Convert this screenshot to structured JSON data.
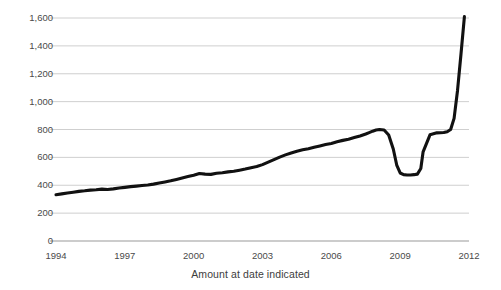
{
  "chart_data": {
    "type": "line",
    "title": "",
    "xlabel": "Amount at date indicated",
    "ylabel": "Billions of dollars",
    "xlim": [
      1994,
      2012
    ],
    "ylim": [
      0,
      1600
    ],
    "xticks": [
      "1994",
      "1997",
      "2000",
      "2003",
      "2006",
      "2009",
      "2012"
    ],
    "xtick_values": [
      1994,
      1997,
      2000,
      2003,
      2006,
      2009,
      2012
    ],
    "yticks": [
      "0",
      "200",
      "400",
      "600",
      "800",
      "1,000",
      "1,200",
      "1,400",
      "1,600"
    ],
    "ytick_values": [
      0,
      200,
      400,
      600,
      800,
      1000,
      1200,
      1400,
      1600
    ],
    "grid": "horizontal",
    "legend": "none",
    "line_color": "#111111",
    "grid_color": "#c9c9c9",
    "axis_color": "#9a9a9a",
    "series": [
      {
        "name": "Amount at date indicated",
        "x": [
          1994.0,
          1994.25,
          1994.5,
          1994.75,
          1995.0,
          1995.25,
          1995.5,
          1995.75,
          1996.0,
          1996.25,
          1996.5,
          1996.75,
          1997.0,
          1997.25,
          1997.5,
          1997.75,
          1998.0,
          1998.25,
          1998.5,
          1998.75,
          1999.0,
          1999.25,
          1999.5,
          1999.75,
          2000.0,
          2000.25,
          2000.5,
          2000.75,
          2001.0,
          2001.25,
          2001.5,
          2001.75,
          2002.0,
          2002.25,
          2002.5,
          2002.75,
          2003.0,
          2003.25,
          2003.5,
          2003.75,
          2004.0,
          2004.25,
          2004.5,
          2004.75,
          2005.0,
          2005.25,
          2005.5,
          2005.75,
          2006.0,
          2006.25,
          2006.5,
          2006.75,
          2007.0,
          2007.25,
          2007.5,
          2007.65,
          2007.8,
          2007.95,
          2008.1,
          2008.3,
          2008.5,
          2008.7,
          2008.85,
          2009.0,
          2009.15,
          2009.3,
          2009.45,
          2009.6,
          2009.75,
          2009.9,
          2010.0,
          2010.3,
          2010.6,
          2010.9,
          2011.05,
          2011.2,
          2011.35,
          2011.5,
          2011.65,
          2011.8
        ],
        "y": [
          332,
          338,
          344,
          350,
          356,
          360,
          365,
          368,
          372,
          370,
          374,
          380,
          385,
          390,
          394,
          398,
          402,
          408,
          416,
          424,
          432,
          442,
          452,
          462,
          472,
          484,
          480,
          478,
          486,
          490,
          496,
          500,
          508,
          516,
          526,
          534,
          548,
          566,
          584,
          602,
          618,
          632,
          644,
          654,
          662,
          672,
          682,
          692,
          700,
          712,
          722,
          730,
          742,
          754,
          768,
          778,
          788,
          796,
          800,
          796,
          760,
          660,
          545,
          488,
          476,
          474,
          474,
          476,
          480,
          520,
          640,
          762,
          776,
          778,
          784,
          800,
          880,
          1080,
          1340,
          1610
        ]
      }
    ],
    "annotations": [
      {
        "label": "start-1994",
        "value": 332
      },
      {
        "label": "pre-crisis-peak-2008",
        "value": 800
      },
      {
        "label": "trough-2009",
        "value": 474
      },
      {
        "label": "recovery-plateau-2010",
        "value": 778
      },
      {
        "label": "end-peak",
        "value": 1610
      }
    ]
  }
}
